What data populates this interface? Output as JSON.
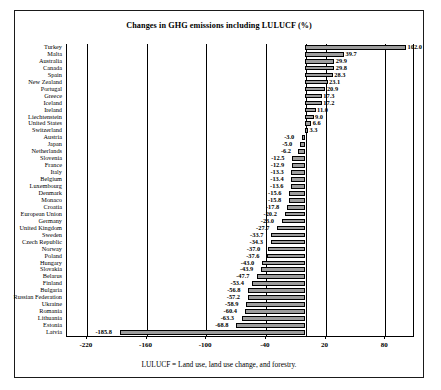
{
  "chart_data": {
    "type": "bar",
    "orientation": "horizontal",
    "title": "Changes in GHG emissions including LULUCF (%)",
    "xlabel": "",
    "ylabel": "",
    "xlim": [
      -240,
      110
    ],
    "xticks": [
      -220,
      -160,
      -100,
      -40,
      20,
      80
    ],
    "xtick_labels": [
      "-220",
      "-160",
      "-100",
      "-40",
      "20",
      "80"
    ],
    "grid": true,
    "legend": false,
    "bar_fill_color": "#9d9d9d",
    "bar_edge_color": "#000000",
    "categories": [
      "Turkey",
      "Malta",
      "Australia",
      "Canada",
      "Spain",
      "New Zealand",
      "Portugal",
      "Greece",
      "Iceland",
      "Ireland",
      "Liechtenstein",
      "United States",
      "Switzerland",
      "Austria",
      "Japan",
      "Netherlands",
      "Slovenia",
      "France",
      "Italy",
      "Belgium",
      "Luxembourg",
      "Denmark",
      "Monaco",
      "Croatia",
      "European Union",
      "Germany",
      "United Kingdom",
      "Sweden",
      "Czech Republic",
      "Norway",
      "Poland",
      "Hungary",
      "Slovakia",
      "Belarus",
      "Finland",
      "Bulgaria",
      "Russian Federation",
      "Ukraine",
      "Romania",
      "Lithuania",
      "Estonia",
      "Latvia"
    ],
    "values": [
      102.0,
      39.7,
      29.9,
      29.8,
      28.3,
      23.1,
      20.9,
      17.3,
      17.2,
      11.0,
      9.0,
      6.6,
      3.3,
      -3.0,
      -5.0,
      -6.2,
      -12.5,
      -12.9,
      -13.3,
      -13.4,
      -13.6,
      -15.6,
      -15.8,
      -17.8,
      -20.2,
      -23.0,
      -27.7,
      -33.7,
      -34.3,
      -37.0,
      -37.6,
      -43.0,
      -43.9,
      -47.7,
      -53.4,
      -56.8,
      -57.2,
      -58.9,
      -60.4,
      -63.3,
      -68.8,
      -185.8
    ],
    "value_labels": [
      "102.0",
      "39.7",
      "29.9",
      "29.8",
      "28.3",
      "23.1",
      "20.9",
      "17.3",
      "17.2",
      "11.0",
      "9.0",
      "6.6",
      "3.3",
      "-3.0",
      "-5.0",
      "-6.2",
      "-12.5",
      "-12.9",
      "-13.3",
      "-13.4",
      "-13.6",
      "-15.6",
      "-15.8",
      "-17.8",
      "-20.2",
      "-23.0",
      "-27.7",
      "-33.7",
      "-34.3",
      "-37.0",
      "-37.6",
      "-43.0",
      "-43.9",
      "-47.7",
      "-53.4",
      "-56.8",
      "-57.2",
      "-58.9",
      "-60.4",
      "-63.3",
      "-68.8",
      "-185.8"
    ]
  },
  "caption": {
    "text": "LULUCF = Land use, land use change, and forestry."
  }
}
